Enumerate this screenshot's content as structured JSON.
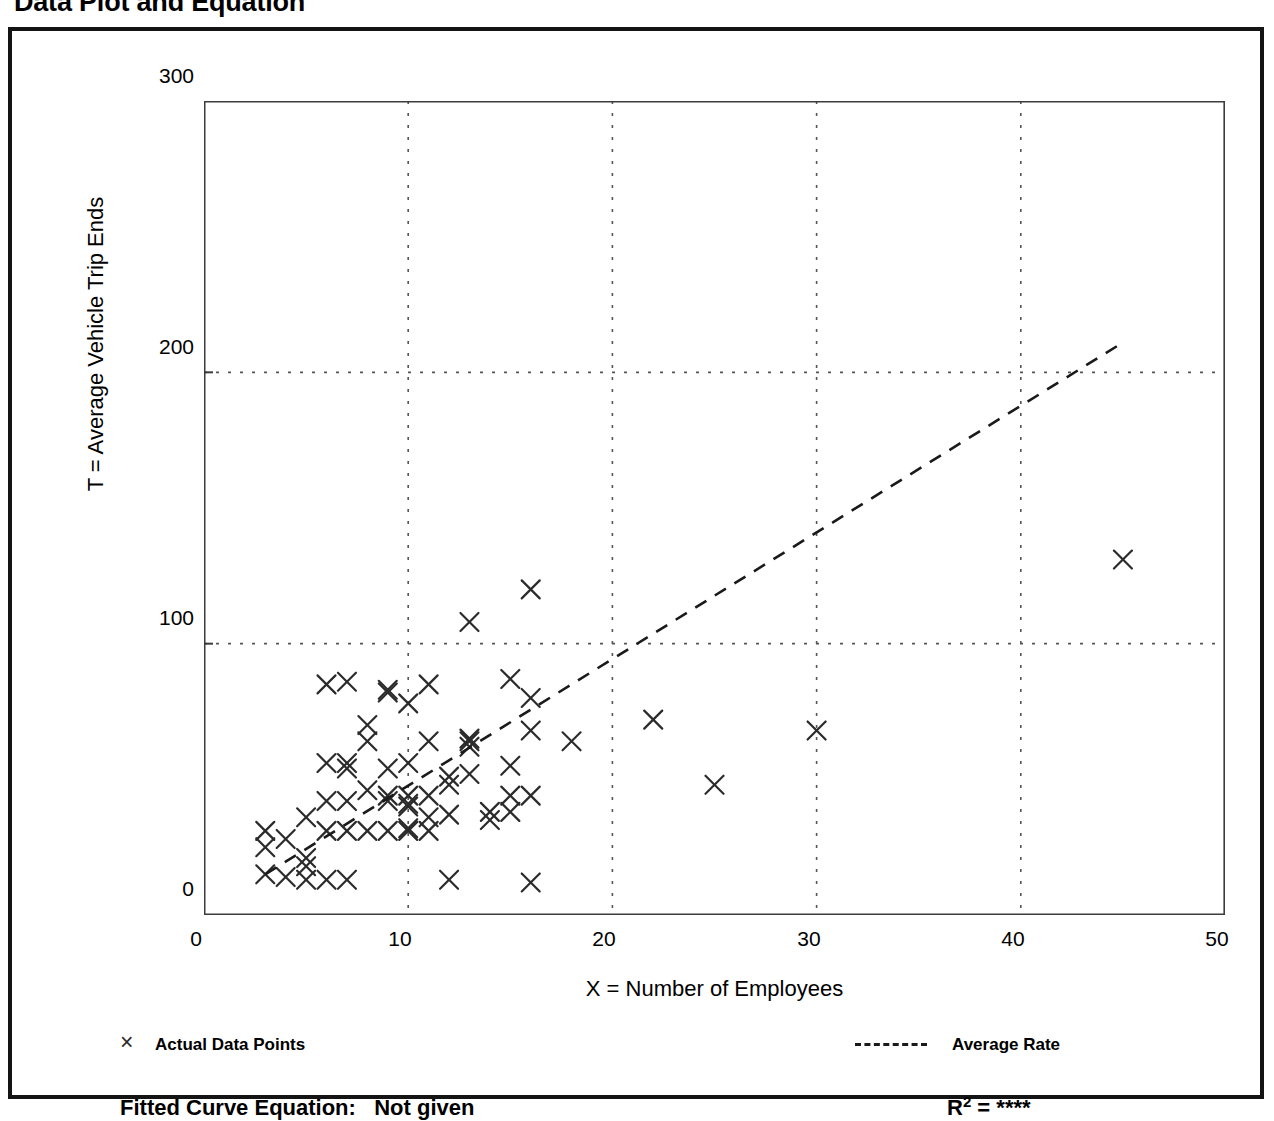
{
  "page": {
    "title": "Data Plot and Equation"
  },
  "axes": {
    "x_title": "X = Number of Employees",
    "y_title": "T = Average Vehicle Trip Ends",
    "x_ticks": [
      "0",
      "10",
      "20",
      "30",
      "40",
      "50"
    ],
    "y_ticks": [
      "0",
      "100",
      "200",
      "300"
    ]
  },
  "legend": {
    "marker_glyph": "×",
    "points_label": "Actual Data Points",
    "rate_label": "Average Rate"
  },
  "footer": {
    "equation_label": "Fitted Curve Equation:",
    "equation_value": "Not given",
    "r_label": "R",
    "r_exponent": "2",
    "r_equals": "=",
    "r_value": "****"
  },
  "colors": {
    "frame": "#141414",
    "axis": "#3c3c3c",
    "grid": "#555555",
    "marker": "#2b2b2b",
    "trend": "#1a1a1a",
    "background": "#ffffff"
  },
  "chart_data": {
    "type": "scatter",
    "title": "Data Plot and Equation",
    "xlabel": "X = Number of Employees",
    "ylabel": "T = Average Vehicle Trip Ends",
    "xlim": [
      0,
      50
    ],
    "ylim": [
      0,
      300
    ],
    "xticks": [
      0,
      10,
      20,
      30,
      40,
      50
    ],
    "yticks": [
      0,
      100,
      200,
      300
    ],
    "x_minor_tick_interval": 5,
    "grid": true,
    "grid_style": "dotted",
    "grid_x_values": [
      10,
      20,
      30,
      40
    ],
    "grid_y_values": [
      100,
      200
    ],
    "legend_position": "below-plot",
    "series": [
      {
        "name": "Actual Data Points",
        "type": "scatter",
        "marker": "x",
        "points": [
          [
            3,
            15
          ],
          [
            3,
            25
          ],
          [
            3,
            31
          ],
          [
            4,
            14
          ],
          [
            4,
            28
          ],
          [
            5,
            13
          ],
          [
            5,
            18
          ],
          [
            5,
            21
          ],
          [
            5,
            36
          ],
          [
            6,
            13
          ],
          [
            6,
            31
          ],
          [
            6,
            42
          ],
          [
            6,
            56
          ],
          [
            6,
            85
          ],
          [
            7,
            13
          ],
          [
            7,
            31
          ],
          [
            7,
            42
          ],
          [
            7,
            54
          ],
          [
            7,
            56
          ],
          [
            7,
            86
          ],
          [
            8,
            31
          ],
          [
            8,
            46
          ],
          [
            8,
            64
          ],
          [
            8,
            70
          ],
          [
            9,
            31
          ],
          [
            9,
            42
          ],
          [
            9,
            44
          ],
          [
            9,
            54
          ],
          [
            9,
            82
          ],
          [
            9,
            83
          ],
          [
            10,
            31
          ],
          [
            10,
            32
          ],
          [
            10,
            40
          ],
          [
            10,
            41
          ],
          [
            10,
            44
          ],
          [
            10,
            56
          ],
          [
            10,
            78
          ],
          [
            11,
            31
          ],
          [
            11,
            36
          ],
          [
            11,
            44
          ],
          [
            11,
            64
          ],
          [
            11,
            85
          ],
          [
            12,
            13
          ],
          [
            12,
            37
          ],
          [
            12,
            48
          ],
          [
            12,
            51
          ],
          [
            13,
            52
          ],
          [
            13,
            62
          ],
          [
            13,
            64
          ],
          [
            13,
            65
          ],
          [
            13,
            108
          ],
          [
            14,
            35
          ],
          [
            14,
            38
          ],
          [
            15,
            38
          ],
          [
            15,
            44
          ],
          [
            15,
            55
          ],
          [
            15,
            87
          ],
          [
            16,
            12
          ],
          [
            16,
            44
          ],
          [
            16,
            68
          ],
          [
            16,
            80
          ],
          [
            16,
            120
          ],
          [
            18,
            64
          ],
          [
            22,
            72
          ],
          [
            25,
            48
          ],
          [
            30,
            68
          ],
          [
            45,
            131
          ]
        ]
      },
      {
        "name": "Average Rate",
        "type": "line",
        "style": "dashed",
        "endpoints": [
          [
            3,
            15
          ],
          [
            45,
            211
          ]
        ]
      }
    ]
  }
}
